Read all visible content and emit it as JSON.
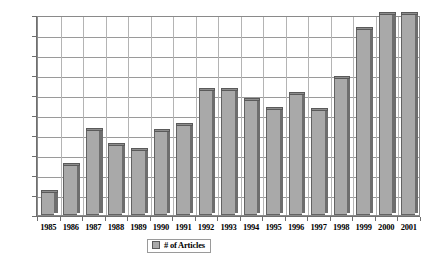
{
  "chart_data": {
    "type": "bar",
    "title": "",
    "subtitle": "",
    "xlabel": "",
    "ylabel": "",
    "categories": [
      "1985",
      "1986",
      "1987",
      "1988",
      "1989",
      "1990",
      "1991",
      "1992",
      "1993",
      "1994",
      "1995",
      "1996",
      "1997",
      "1998",
      "1999",
      "2000",
      "2001"
    ],
    "values": [
      110,
      245,
      420,
      345,
      320,
      415,
      445,
      620,
      620,
      570,
      525,
      600,
      520,
      680,
      925,
      1000,
      1000
    ],
    "series": [
      {
        "name": "# of Articles",
        "values": [
          110,
          245,
          420,
          345,
          320,
          415,
          445,
          620,
          620,
          570,
          525,
          600,
          520,
          680,
          925,
          1000,
          1000
        ]
      }
    ],
    "ylim": [
      0,
      1000
    ],
    "ytick_values": [
      0,
      100,
      200,
      300,
      400,
      500,
      600,
      700,
      800,
      900,
      1000
    ],
    "ytick_labels": [
      "0",
      "100",
      "200",
      "300",
      "400",
      "500",
      "600",
      "700",
      "800",
      "900",
      "1000"
    ],
    "grid": "horizontal",
    "legend_position": "bottom",
    "legend_entries": [
      "# of Articles"
    ],
    "bar_color": "#a9a9a9",
    "bar_edge_color": "#5a5a5a",
    "gridline_color": "#9a9a9a",
    "axis_color": "#6f6f6f",
    "background_color": "#ffffff"
  }
}
